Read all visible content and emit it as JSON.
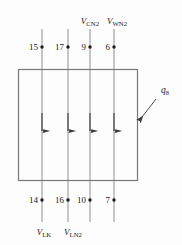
{
  "figure": {
    "background_color": "#fdfdfd",
    "line_color": "#8a8a8a",
    "box_stroke_color": "#787878",
    "text_color": "#1a1a1a"
  },
  "control_volume": {
    "name": "control-volume-box",
    "x": 18,
    "y": 69,
    "width": 120,
    "height": 112
  },
  "streams": [
    {
      "id": "stream-1",
      "x": 42,
      "top_y": 29,
      "bottom_y": 222,
      "direction": "up",
      "arrow_y": 122,
      "top_node": "15",
      "bottom_node": "14",
      "top_label": "",
      "top_label_sub": "",
      "bottom_label_sym": "V",
      "bottom_label_sub": "LK"
    },
    {
      "id": "stream-2",
      "x": 68,
      "top_y": 29,
      "bottom_y": 222,
      "direction": "up",
      "arrow_y": 122,
      "top_node": "17",
      "bottom_node": "16",
      "top_label": "",
      "top_label_sub": "",
      "bottom_label_sym": "V",
      "bottom_label_sub": "LN",
      "bottom_label_sub2": "2"
    },
    {
      "id": "stream-3",
      "x": 90,
      "top_y": 29,
      "bottom_y": 222,
      "direction": "down",
      "arrow_y": 122,
      "top_node": "9",
      "bottom_node": "10",
      "top_label_sym": "V",
      "top_label_sub": "CN",
      "top_label_sub2": "2",
      "bottom_label_sym": "",
      "bottom_label_sub": ""
    },
    {
      "id": "stream-4",
      "x": 114,
      "top_y": 29,
      "bottom_y": 222,
      "direction": "down",
      "arrow_y": 122,
      "top_node": "6",
      "bottom_node": "7",
      "top_label_sym": "V",
      "top_label_sub": "WN",
      "top_label_sub2": "2",
      "bottom_label_sym": "",
      "bottom_label_sub": ""
    }
  ],
  "top_labels": [
    {
      "name": "label-v-cn2",
      "symbol": "V",
      "sub": "CN",
      "sub2": "2",
      "x": 90,
      "y": 22
    },
    {
      "name": "label-v-wn2",
      "symbol": "V",
      "sub": "WN",
      "sub2": "2",
      "x": 116,
      "y": 22
    }
  ],
  "bottom_labels": [
    {
      "name": "label-v-lk",
      "symbol": "V",
      "sub": "LK",
      "sub2": "",
      "x": 44,
      "y": 233
    },
    {
      "name": "label-v-ln2",
      "symbol": "V",
      "sub": "LN",
      "sub2": "2",
      "x": 72,
      "y": 233
    }
  ],
  "top_nodes": [
    {
      "name": "node-15",
      "value": "15",
      "x": 42,
      "y": 47
    },
    {
      "name": "node-17",
      "value": "17",
      "x": 68,
      "y": 47
    },
    {
      "name": "node-9",
      "value": "9",
      "x": 90,
      "y": 47
    },
    {
      "name": "node-6",
      "value": "6",
      "x": 114,
      "y": 47
    }
  ],
  "bottom_nodes": [
    {
      "name": "node-14",
      "value": "14",
      "x": 42,
      "y": 200
    },
    {
      "name": "node-16",
      "value": "16",
      "x": 68,
      "y": 200
    },
    {
      "name": "node-10",
      "value": "10",
      "x": 90,
      "y": 200
    },
    {
      "name": "node-7",
      "value": "7",
      "x": 114,
      "y": 200
    }
  ],
  "heat_flux": {
    "name": "heat-flux-annotation",
    "symbol": "q",
    "sub": "8",
    "label_x": 163,
    "label_y": 92,
    "leader_from_x": 156,
    "leader_from_y": 99,
    "leader_to_x": 139,
    "leader_to_y": 121
  }
}
